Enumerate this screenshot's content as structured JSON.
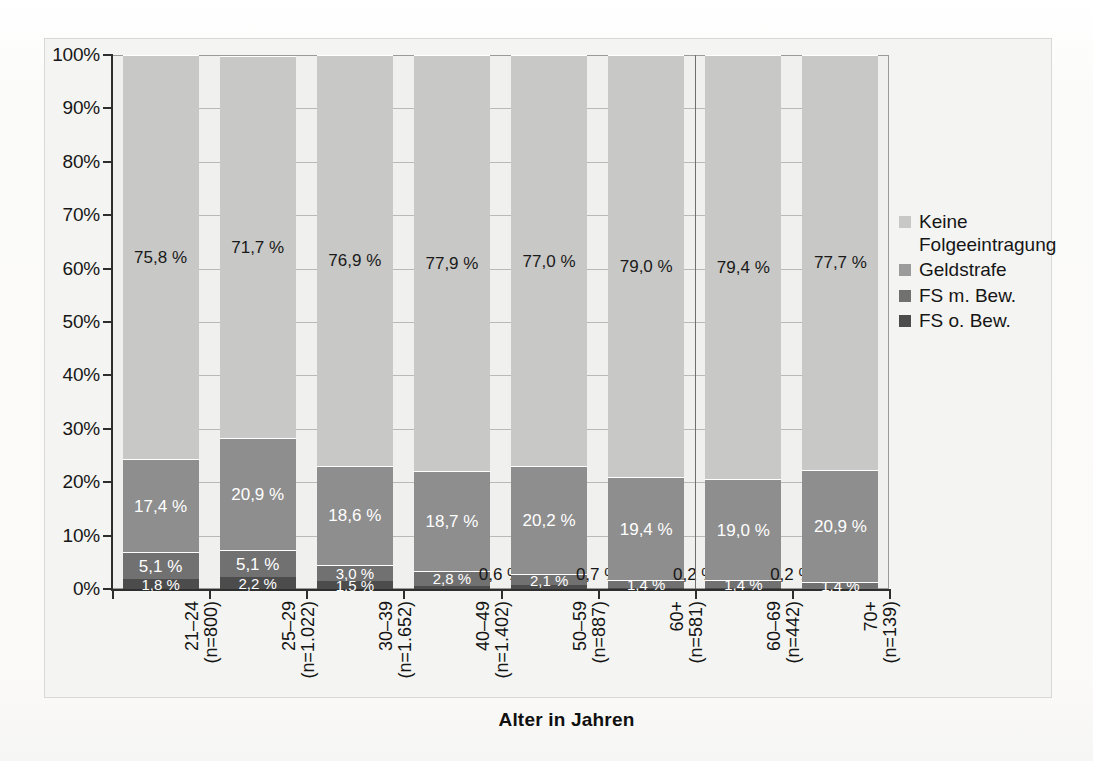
{
  "chart_data": {
    "type": "bar",
    "subtype": "stacked-100-percent",
    "title": "",
    "xlabel": "Alter in Jahren",
    "ylabel": "",
    "ylim": [
      0,
      100
    ],
    "grid": false,
    "legend_position": "right",
    "y_ticks": [
      "0%",
      "10%",
      "20%",
      "30%",
      "40%",
      "50%",
      "60%",
      "70%",
      "80%",
      "90%",
      "100%"
    ],
    "categories": [
      {
        "line1": "21–24",
        "line2": "(n=800)"
      },
      {
        "line1": "25–29",
        "line2": "(n=1.022)"
      },
      {
        "line1": "30–39",
        "line2": "(n=1.652)"
      },
      {
        "line1": "40–49",
        "line2": "(n=1.402)"
      },
      {
        "line1": "50–59",
        "line2": "(n=887)"
      },
      {
        "line1": "60+",
        "line2": "(n=581)"
      },
      {
        "line1": "60–69",
        "line2": "(n=442)"
      },
      {
        "line1": "70+",
        "line2": "(n=139)"
      }
    ],
    "series": [
      {
        "name": "FS o. Bew.",
        "color": "#4c4c4c",
        "values": [
          1.8,
          2.2,
          1.5,
          0.6,
          0.7,
          0.2,
          0.2,
          0.0
        ],
        "labels": [
          "1,8 %",
          "2,2 %",
          "1,5 %",
          "0,6 %",
          "0,7 %",
          "0,2 %",
          "0,2 %",
          ""
        ],
        "label_outside": [
          false,
          false,
          false,
          true,
          true,
          true,
          true,
          false
        ]
      },
      {
        "name": "FS m. Bew.",
        "color": "#717171",
        "values": [
          5.1,
          5.1,
          3.0,
          2.8,
          2.1,
          1.4,
          1.4,
          1.4
        ],
        "labels": [
          "5,1 %",
          "5,1 %",
          "3,0 %",
          "2,8 %",
          "2,1 %",
          "1,4 %",
          "1,4 %",
          "1,4 %"
        ],
        "label_outside": [
          false,
          false,
          false,
          false,
          false,
          false,
          false,
          false
        ]
      },
      {
        "name": "Geldstrafe",
        "color": "#8e8e8e",
        "values": [
          17.4,
          20.9,
          18.6,
          18.7,
          20.2,
          19.4,
          19.0,
          20.9
        ],
        "labels": [
          "17,4 %",
          "20,9 %",
          "18,6 %",
          "18,7 %",
          "20,2 %",
          "19,4 %",
          "19,0 %",
          "20,9 %"
        ],
        "label_outside": [
          false,
          false,
          false,
          false,
          false,
          false,
          false,
          false
        ]
      },
      {
        "name": "Keine Folgeeintragung",
        "color": "#c8c8c6",
        "values": [
          75.8,
          71.7,
          76.9,
          77.9,
          77.0,
          79.0,
          79.4,
          77.7
        ],
        "labels": [
          "75,8 %",
          "71,7 %",
          "76,9 %",
          "77,9 %",
          "77,0 %",
          "79,0 %",
          "79,4 %",
          "77,7 %"
        ],
        "label_outside": [
          false,
          false,
          false,
          false,
          false,
          false,
          false,
          false
        ]
      }
    ],
    "legend": [
      {
        "label": "Keine Folgeeintragung",
        "color": "#c8c8c6"
      },
      {
        "label": "Geldstrafe",
        "color": "#9b9b9b"
      },
      {
        "label": "FS m. Bew.",
        "color": "#717171"
      },
      {
        "label": "FS o. Bew.",
        "color": "#4c4c4c"
      }
    ],
    "separator_after_category_index": 5
  }
}
